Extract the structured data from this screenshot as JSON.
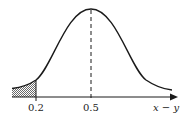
{
  "diagram": {
    "type": "normal-distribution-curve",
    "x_axis_label": "x − y",
    "ticks": [
      {
        "label": "0.2",
        "role": "shaded-tail-boundary"
      },
      {
        "label": "0.5",
        "role": "mean"
      }
    ],
    "shaded_region": "left tail, x − y < 0.2",
    "mean_line": "dashed vertical at 0.5",
    "colors": {
      "line": "#1a1a1a",
      "shade": "#9a9a9a",
      "background": "#ffffff"
    }
  }
}
